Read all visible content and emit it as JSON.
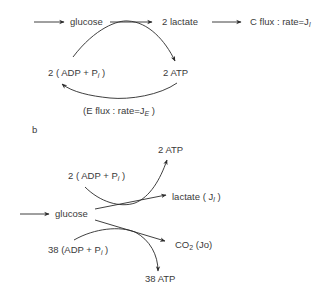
{
  "panel_a": {
    "glucose": "glucose",
    "lactate": "2 lactate",
    "c_flux_prefix": "C flux : rate=J",
    "c_flux_sub": "l",
    "adp_prefix": "2 ( ADP + P",
    "adp_sub": "i",
    "adp_suffix": " )",
    "atp": "2 ATP",
    "e_flux_prefix": "(E flux : rate=J",
    "e_flux_sub": "E",
    "e_flux_suffix": " )"
  },
  "panel_b": {
    "label": "b",
    "atp_top": "2 ATP",
    "adp_top_prefix": "2 ( ADP + P",
    "adp_top_sub": "i",
    "adp_top_suffix": " )",
    "lactate_prefix": "lactate  ( J",
    "lactate_sub": "l",
    "lactate_suffix": " )",
    "glucose": "glucose",
    "co2_prefix": "CO",
    "co2_sub": "2",
    "co2_suffix": "  (Jo)",
    "adp_bottom_prefix": "38 (ADP + P",
    "adp_bottom_sub": "i",
    "adp_bottom_suffix": " )",
    "atp_bottom": "38 ATP"
  },
  "colors": {
    "ink": "#3a3a3a",
    "background": "#ffffff"
  }
}
